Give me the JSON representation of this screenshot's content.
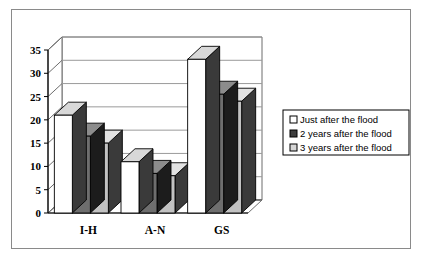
{
  "figure": {
    "border_color": "#8a8a8a",
    "background": "#ffffff"
  },
  "chart_data": {
    "type": "bar",
    "title": "",
    "subtitle": "",
    "xlabel": "",
    "ylabel": "",
    "categories": [
      "I-H",
      "A-N",
      "GS"
    ],
    "series": [
      {
        "name": "Just after the flood",
        "values": [
          21,
          11,
          33
        ],
        "color": "#ffffff",
        "side_color": "#3a3a3a",
        "top_color": "#d8d8d8",
        "edge_color": "#000000"
      },
      {
        "name": "2 years after the flood",
        "values": [
          16.5,
          8.5,
          25.5
        ],
        "color": "#6e6e6e",
        "side_color": "#1c1c1c",
        "top_color": "#8c8c8c",
        "edge_color": "#000000"
      },
      {
        "name": "3 years after the flood",
        "values": [
          15,
          8,
          24
        ],
        "color": "#c2c2c2",
        "side_color": "#3a3a3a",
        "top_color": "#e2e2e2",
        "edge_color": "#000000"
      }
    ],
    "ylim": [
      0,
      35
    ],
    "yticks": [
      0,
      5,
      10,
      15,
      20,
      25,
      30,
      35
    ],
    "ytick_labels": [
      "0",
      "5",
      "10",
      "15",
      "20",
      "25",
      "30",
      "35"
    ],
    "grid": true,
    "grid_color": "#9a9a9a",
    "axis_color": "#6d6d6d",
    "legend_position": "right",
    "style": "3d-column"
  },
  "legend": {
    "items": [
      {
        "label": "Just after the flood",
        "swatch": "#ffffff",
        "swatch_border": "#000000"
      },
      {
        "label": "2 years after the flood",
        "swatch": "#3d3d3d",
        "swatch_border": "#000000"
      },
      {
        "label": "3 years after the flood",
        "swatch": "#d6d6d6",
        "swatch_border": "#000000"
      }
    ],
    "border_color": "#000000"
  }
}
